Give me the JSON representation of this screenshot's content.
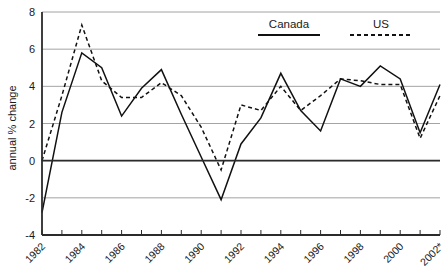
{
  "chart_data": {
    "type": "line",
    "title": "",
    "xlabel": "",
    "ylabel": "annual % change",
    "ylim": [
      -4,
      8
    ],
    "yticks": [
      8,
      6,
      4,
      2,
      0,
      -2,
      -4
    ],
    "ytick_labels": [
      "8",
      "6",
      "4",
      "2",
      "0",
      "-2",
      "-4"
    ],
    "grid": true,
    "legend_position": "top-right",
    "x": [
      1982,
      1983,
      1984,
      1985,
      1986,
      1987,
      1988,
      1989,
      1990,
      1991,
      1992,
      1993,
      1994,
      1995,
      1996,
      1997,
      1998,
      1999,
      2000,
      2001,
      2002
    ],
    "xtick_labels": [
      "1982",
      "",
      "1984",
      "",
      "1986",
      "",
      "1988",
      "",
      "1990",
      "",
      "1992",
      "",
      "1994",
      "",
      "1996",
      "",
      "1998",
      "",
      "2000",
      "",
      "2002*"
    ],
    "xtick_labels_visible": [
      "1982",
      "1984",
      "1986",
      "1988",
      "1990",
      "1992",
      "1994",
      "1996",
      "1998",
      "2000",
      "2002*"
    ],
    "xtick_years_visible": [
      1982,
      1984,
      1986,
      1988,
      1990,
      1992,
      1994,
      1996,
      1998,
      2000,
      2002
    ],
    "series": [
      {
        "name": "Canada",
        "style": "solid",
        "color": "#111111",
        "values": [
          -2.8,
          2.6,
          5.8,
          5.0,
          2.4,
          3.9,
          4.9,
          2.5,
          0.2,
          -2.1,
          0.9,
          2.3,
          4.7,
          2.7,
          1.6,
          4.4,
          4.0,
          5.1,
          4.4,
          1.5,
          4.1
        ]
      },
      {
        "name": "US",
        "style": "dashed",
        "color": "#111111",
        "values": [
          0.0,
          3.5,
          7.3,
          4.3,
          3.4,
          3.4,
          4.2,
          3.5,
          1.8,
          -0.5,
          3.0,
          2.7,
          4.0,
          2.7,
          3.5,
          4.4,
          4.3,
          4.1,
          4.1,
          1.2,
          3.5
        ]
      }
    ],
    "legend": [
      {
        "label": "Canada",
        "style": "solid"
      },
      {
        "label": "US",
        "style": "dashed"
      }
    ],
    "annotations": []
  }
}
